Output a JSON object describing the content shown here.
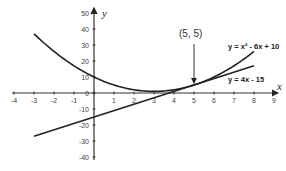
{
  "chart_data": {
    "type": "line",
    "title": "",
    "xlabel": "x",
    "ylabel": "y",
    "xlim": [
      -4,
      9
    ],
    "ylim": [
      -40,
      50
    ],
    "x_ticks": [
      "-4",
      "-3",
      "-2",
      "-1",
      "0",
      "1",
      "2",
      "3",
      "4",
      "5",
      "6",
      "7",
      "8",
      "9"
    ],
    "y_ticks": [
      "50",
      "40",
      "30",
      "20",
      "10",
      "0",
      "-10",
      "-20",
      "-30",
      "-40"
    ],
    "grid": false,
    "series": [
      {
        "name": "y = x² - 6x + 10",
        "kind": "parabola",
        "x": [
          -3,
          -2,
          -1,
          0,
          1,
          2,
          3,
          4,
          5,
          6,
          7,
          8
        ],
        "values": [
          37,
          26,
          17,
          10,
          5,
          2,
          1,
          2,
          5,
          10,
          17,
          26
        ]
      },
      {
        "name": "y = 4x - 15",
        "kind": "line",
        "x": [
          -3,
          8
        ],
        "values": [
          -27,
          17
        ]
      }
    ],
    "annotations": [
      {
        "text": "(5, 5)",
        "point": [
          5,
          5
        ],
        "arrow": true
      }
    ]
  },
  "labels": {
    "x_axis": "x",
    "y_axis": "y",
    "parabola_eq": "y = x² - 6x + 10",
    "line_eq": "y = 4x - 15",
    "point_annotation": "(5, 5)"
  }
}
